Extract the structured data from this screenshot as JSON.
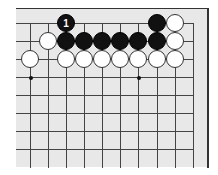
{
  "board": {
    "x_lines": [
      30,
      48,
      66,
      84,
      102,
      120,
      138,
      157,
      175,
      193
    ],
    "y_lines": [
      23,
      41,
      59,
      77,
      95,
      113,
      131,
      149,
      167
    ],
    "star_points": [
      [
        30,
        77
      ],
      [
        138,
        77
      ]
    ],
    "colors": {
      "background": "#e8e8e8",
      "line": "#444444",
      "black": "#111111",
      "white": "#ffffff"
    }
  },
  "stones": [
    {
      "color": "black",
      "x": 66,
      "y": 23,
      "label": "1"
    },
    {
      "color": "black",
      "x": 157,
      "y": 23,
      "label": ""
    },
    {
      "color": "white",
      "x": 175,
      "y": 23,
      "label": ""
    },
    {
      "color": "white",
      "x": 48,
      "y": 41,
      "label": ""
    },
    {
      "color": "black",
      "x": 66,
      "y": 41,
      "label": ""
    },
    {
      "color": "black",
      "x": 84,
      "y": 41,
      "label": ""
    },
    {
      "color": "black",
      "x": 102,
      "y": 41,
      "label": ""
    },
    {
      "color": "black",
      "x": 120,
      "y": 41,
      "label": ""
    },
    {
      "color": "black",
      "x": 138,
      "y": 41,
      "label": ""
    },
    {
      "color": "black",
      "x": 157,
      "y": 41,
      "label": ""
    },
    {
      "color": "white",
      "x": 175,
      "y": 41,
      "label": ""
    },
    {
      "color": "white",
      "x": 30,
      "y": 59,
      "label": ""
    },
    {
      "color": "white",
      "x": 66,
      "y": 59,
      "label": ""
    },
    {
      "color": "white",
      "x": 84,
      "y": 59,
      "label": ""
    },
    {
      "color": "white",
      "x": 102,
      "y": 59,
      "label": ""
    },
    {
      "color": "white",
      "x": 120,
      "y": 59,
      "label": ""
    },
    {
      "color": "white",
      "x": 138,
      "y": 59,
      "label": ""
    },
    {
      "color": "white",
      "x": 157,
      "y": 59,
      "label": ""
    },
    {
      "color": "white",
      "x": 175,
      "y": 59,
      "label": ""
    }
  ]
}
